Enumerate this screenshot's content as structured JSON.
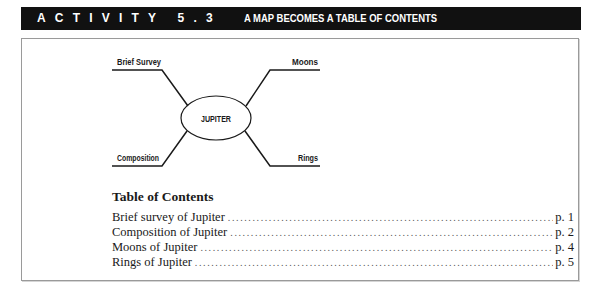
{
  "header": {
    "activity_label": "ACTIVITY 5.3",
    "title": "A MAP BECOMES A TABLE OF CONTENTS",
    "background_color": "#111111",
    "text_color": "#ffffff"
  },
  "map": {
    "center": "JUPITER",
    "branches": [
      {
        "label": "Brief Survey",
        "position": "top-left"
      },
      {
        "label": "Moons",
        "position": "top-right"
      },
      {
        "label": "Composition",
        "position": "bottom-left"
      },
      {
        "label": "Rings",
        "position": "bottom-right"
      }
    ]
  },
  "toc": {
    "heading": "Table of Contents",
    "entries": [
      {
        "title": "Brief survey of Jupiter",
        "page": "p. 1"
      },
      {
        "title": "Composition of Jupiter",
        "page": "p. 2"
      },
      {
        "title": "Moons of Jupiter",
        "page": "p. 4"
      },
      {
        "title": "Rings of Jupiter",
        "page": "p. 5"
      }
    ]
  }
}
